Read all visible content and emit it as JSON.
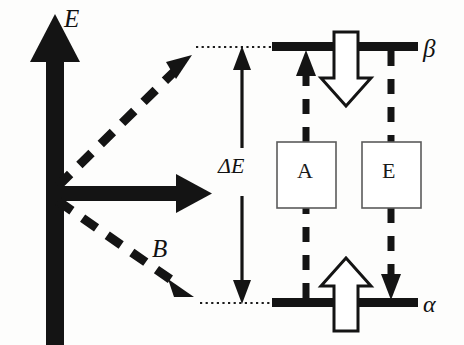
{
  "figure": {
    "type": "energy-level-diagram",
    "background_color": "#fdfdfc",
    "ink_color": "#111111",
    "axes": {
      "energy_axis": {
        "label": "E",
        "direction": "up",
        "style": "thick-solid-black-arrow"
      },
      "field_axis": {
        "label": "B",
        "direction": "right",
        "style": "thick-solid-black-arrow"
      }
    },
    "levels": [
      {
        "id": "beta",
        "label": "β",
        "position": "upper",
        "style": "thick-solid-black-line"
      },
      {
        "id": "alpha",
        "label": "α",
        "position": "lower",
        "style": "thick-solid-black-line"
      }
    ],
    "gap": {
      "label": "ΔE",
      "style": "double-headed-vertical-arrow"
    },
    "processes": [
      {
        "id": "A",
        "label": "A",
        "box": true,
        "transition": "alpha-to-beta",
        "arrow_direction": "up",
        "arrow_style": "dashed"
      },
      {
        "id": "E",
        "label": "E",
        "box": true,
        "transition": "beta-to-alpha",
        "arrow_direction": "down",
        "arrow_style": "dashed"
      }
    ],
    "population_arrows": [
      {
        "id": "beta-population",
        "at_level": "beta",
        "direction": "down",
        "style": "hollow-outline"
      },
      {
        "id": "alpha-population",
        "at_level": "alpha",
        "direction": "up",
        "style": "hollow-outline"
      }
    ],
    "splitting_guides": [
      {
        "id": "upper-branch",
        "style": "dashed-diagonal-arrow",
        "direction": "up-right",
        "leads_to": "beta"
      },
      {
        "id": "lower-branch",
        "style": "dashed-diagonal-arrow",
        "direction": "down-right",
        "leads_to": "alpha"
      }
    ],
    "connectors": [
      {
        "id": "beta-dotted-connector",
        "style": "dotted-horizontal"
      },
      {
        "id": "alpha-dotted-connector",
        "style": "dotted-horizontal"
      }
    ]
  },
  "labels": {
    "energy_axis": "E",
    "field_axis": "B",
    "energy_gap": "ΔE",
    "upper_level": "β",
    "lower_level": "α",
    "box_absorption": "A",
    "box_emission": "E"
  }
}
